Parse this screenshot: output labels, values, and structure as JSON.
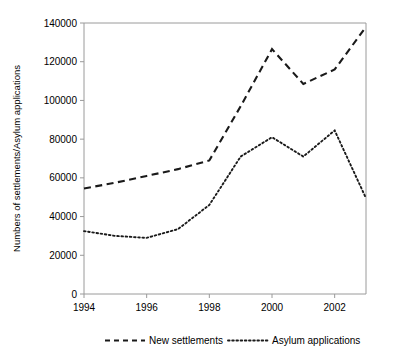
{
  "chart_data": {
    "type": "line",
    "title": "",
    "xlabel": "",
    "ylabel": "Numbers of settlements/Asylum applications",
    "x": [
      1994,
      1995,
      1996,
      1997,
      1998,
      1999,
      2000,
      2001,
      2002,
      2003
    ],
    "xtick_labels": [
      "1994",
      "1996",
      "1998",
      "2000",
      "2002"
    ],
    "xtick_values": [
      1994,
      1996,
      1998,
      2000,
      2002
    ],
    "xlim": [
      1994,
      2003
    ],
    "ytick_labels": [
      "0",
      "20000",
      "40000",
      "60000",
      "80000",
      "100000",
      "120000",
      "140000"
    ],
    "ytick_values": [
      0,
      20000,
      40000,
      60000,
      80000,
      100000,
      120000,
      140000
    ],
    "ylim": [
      0,
      140000
    ],
    "grid": false,
    "legend_position": "bottom",
    "series": [
      {
        "name": "New  settlements",
        "style": "dashed",
        "color": "#1a1a1a",
        "values": [
          54500,
          57500,
          61000,
          64500,
          69000,
          97000,
          126500,
          108500,
          116000,
          138000
        ]
      },
      {
        "name": "Asylum applications",
        "style": "dotted",
        "color": "#1a1a1a",
        "values": [
          32500,
          30000,
          29000,
          33500,
          46000,
          71000,
          81000,
          71000,
          84500,
          49500
        ]
      }
    ]
  }
}
